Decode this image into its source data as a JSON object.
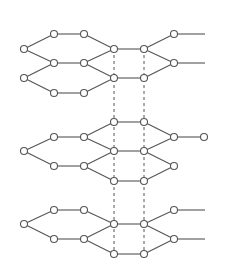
{
  "diagram": {
    "colors": {
      "line": "#555555",
      "node_fill": "#ffffff",
      "background": "#ffffff"
    },
    "node_radius": 3.5,
    "layers": [
      {
        "name": "top-layer",
        "nodes": [
          [
            54,
            34
          ],
          [
            84,
            34
          ],
          [
            174,
            34
          ],
          [
            24,
            49
          ],
          [
            114,
            49
          ],
          [
            144,
            49
          ],
          [
            54,
            63
          ],
          [
            84,
            63
          ],
          [
            174,
            63
          ],
          [
            24,
            78
          ],
          [
            114,
            78
          ],
          [
            144,
            78
          ],
          [
            54,
            93
          ],
          [
            84,
            93
          ]
        ],
        "edges": [
          [
            [
              54,
              34
            ],
            [
              84,
              34
            ]
          ],
          [
            [
              24,
              49
            ],
            [
              54,
              34
            ]
          ],
          [
            [
              84,
              34
            ],
            [
              114,
              49
            ]
          ],
          [
            [
              114,
              49
            ],
            [
              144,
              49
            ]
          ],
          [
            [
              144,
              49
            ],
            [
              174,
              34
            ]
          ],
          [
            [
              174,
              34
            ],
            [
              205,
              34
            ]
          ],
          [
            [
              24,
              49
            ],
            [
              54,
              63
            ]
          ],
          [
            [
              54,
              63
            ],
            [
              84,
              63
            ]
          ],
          [
            [
              84,
              63
            ],
            [
              114,
              49
            ]
          ],
          [
            [
              144,
              49
            ],
            [
              174,
              63
            ]
          ],
          [
            [
              174,
              63
            ],
            [
              205,
              63
            ]
          ],
          [
            [
              54,
              63
            ],
            [
              24,
              78
            ]
          ],
          [
            [
              84,
              63
            ],
            [
              114,
              78
            ]
          ],
          [
            [
              114,
              78
            ],
            [
              144,
              78
            ]
          ],
          [
            [
              144,
              78
            ],
            [
              174,
              63
            ]
          ],
          [
            [
              24,
              78
            ],
            [
              54,
              93
            ]
          ],
          [
            [
              54,
              93
            ],
            [
              84,
              93
            ]
          ],
          [
            [
              84,
              93
            ],
            [
              114,
              78
            ]
          ]
        ]
      },
      {
        "name": "middle-layer",
        "nodes": [
          [
            114,
            122
          ],
          [
            144,
            122
          ],
          [
            54,
            137
          ],
          [
            84,
            137
          ],
          [
            174,
            137
          ],
          [
            204,
            137
          ],
          [
            24,
            151
          ],
          [
            114,
            151
          ],
          [
            144,
            151
          ],
          [
            54,
            166
          ],
          [
            84,
            166
          ],
          [
            174,
            166
          ],
          [
            114,
            181
          ],
          [
            144,
            181
          ]
        ],
        "edges": [
          [
            [
              114,
              122
            ],
            [
              144,
              122
            ]
          ],
          [
            [
              84,
              137
            ],
            [
              114,
              122
            ]
          ],
          [
            [
              144,
              122
            ],
            [
              174,
              137
            ]
          ],
          [
            [
              174,
              137
            ],
            [
              204,
              137
            ]
          ],
          [
            [
              54,
              137
            ],
            [
              84,
              137
            ]
          ],
          [
            [
              24,
              151
            ],
            [
              54,
              137
            ]
          ],
          [
            [
              84,
              137
            ],
            [
              114,
              151
            ]
          ],
          [
            [
              114,
              151
            ],
            [
              144,
              151
            ]
          ],
          [
            [
              144,
              151
            ],
            [
              174,
              137
            ]
          ],
          [
            [
              24,
              151
            ],
            [
              54,
              166
            ]
          ],
          [
            [
              54,
              166
            ],
            [
              84,
              166
            ]
          ],
          [
            [
              84,
              166
            ],
            [
              114,
              151
            ]
          ],
          [
            [
              144,
              151
            ],
            [
              174,
              166
            ]
          ],
          [
            [
              84,
              166
            ],
            [
              114,
              181
            ]
          ],
          [
            [
              114,
              181
            ],
            [
              144,
              181
            ]
          ],
          [
            [
              144,
              181
            ],
            [
              174,
              166
            ]
          ]
        ]
      },
      {
        "name": "bottom-layer",
        "nodes": [
          [
            54,
            210
          ],
          [
            84,
            210
          ],
          [
            174,
            210
          ],
          [
            24,
            224
          ],
          [
            114,
            224
          ],
          [
            144,
            224
          ],
          [
            54,
            239
          ],
          [
            84,
            239
          ],
          [
            174,
            239
          ],
          [
            114,
            254
          ],
          [
            144,
            254
          ]
        ],
        "edges": [
          [
            [
              54,
              210
            ],
            [
              84,
              210
            ]
          ],
          [
            [
              24,
              224
            ],
            [
              54,
              210
            ]
          ],
          [
            [
              84,
              210
            ],
            [
              114,
              224
            ]
          ],
          [
            [
              114,
              224
            ],
            [
              144,
              224
            ]
          ],
          [
            [
              144,
              224
            ],
            [
              174,
              210
            ]
          ],
          [
            [
              174,
              210
            ],
            [
              205,
              210
            ]
          ],
          [
            [
              24,
              224
            ],
            [
              54,
              239
            ]
          ],
          [
            [
              54,
              239
            ],
            [
              84,
              239
            ]
          ],
          [
            [
              84,
              239
            ],
            [
              114,
              224
            ]
          ],
          [
            [
              144,
              224
            ],
            [
              174,
              239
            ]
          ],
          [
            [
              174,
              239
            ],
            [
              205,
              239
            ]
          ],
          [
            [
              84,
              239
            ],
            [
              114,
              254
            ]
          ],
          [
            [
              114,
              254
            ],
            [
              144,
              254
            ]
          ],
          [
            [
              144,
              254
            ],
            [
              174,
              239
            ]
          ]
        ]
      }
    ],
    "interlayer_links": [
      [
        [
          114,
          49
        ],
        [
          114,
          254
        ]
      ],
      [
        [
          144,
          49
        ],
        [
          144,
          254
        ]
      ]
    ]
  }
}
